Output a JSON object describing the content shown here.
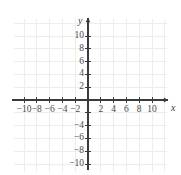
{
  "figure": {
    "kind": "cartesian-coordinate-plane",
    "width": 181,
    "height": 175,
    "background_color": "#ffffff"
  },
  "axes": {
    "x_name": "x",
    "y_name": "y",
    "axis_color": "#3a3a3a",
    "grid_color": "#ededed",
    "label_color": "#4a4a4a",
    "origin_px": {
      "x": 88,
      "y": 100
    },
    "pixels_per_unit": 6.4,
    "xlim": [
      -11.5,
      12.5
    ],
    "ylim": [
      -11.3,
      12.8
    ],
    "grid": true,
    "grid_step": 2,
    "tick_step": 2,
    "arrowheads": [
      "x-positive",
      "y-positive"
    ]
  },
  "chart_data": {
    "type": "scatter",
    "title": "",
    "xlabel": "x",
    "ylabel": "y",
    "series": [],
    "x": [],
    "values": [],
    "xlim": [
      -11.5,
      12.5
    ],
    "ylim": [
      -11.3,
      12.8
    ],
    "grid": true,
    "legend": "none",
    "x_ticks": [
      -10,
      -8,
      -6,
      -4,
      -2,
      2,
      4,
      6,
      8,
      10
    ],
    "y_ticks": [
      -10,
      -8,
      -6,
      -4,
      -2,
      2,
      4,
      6,
      8,
      10
    ],
    "x_tick_labels": [
      "-10",
      "-8",
      "-6",
      "-4",
      "-2",
      "2",
      "4",
      "6",
      "8",
      "10"
    ],
    "y_tick_labels": [
      "10",
      "8",
      "6",
      "4",
      "2",
      "-4",
      "-6",
      "-8",
      "-10"
    ],
    "y_tick_label_values": [
      10,
      8,
      6,
      4,
      2,
      -4,
      -6,
      -8,
      -10
    ]
  },
  "x_tick_labels": [
    {
      "value": -10,
      "text": "−10"
    },
    {
      "value": -8,
      "text": "−8"
    },
    {
      "value": -6,
      "text": "−6"
    },
    {
      "value": -4,
      "text": "−4"
    },
    {
      "value": -2,
      "text": "−2"
    },
    {
      "value": 2,
      "text": "2"
    },
    {
      "value": 4,
      "text": "4"
    },
    {
      "value": 6,
      "text": "6"
    },
    {
      "value": 8,
      "text": "8"
    },
    {
      "value": 10,
      "text": "10"
    }
  ],
  "y_tick_labels": [
    {
      "value": 10,
      "text": "10"
    },
    {
      "value": 8,
      "text": "8"
    },
    {
      "value": 6,
      "text": "6"
    },
    {
      "value": 4,
      "text": "4"
    },
    {
      "value": 2,
      "text": "2"
    },
    {
      "value": -4,
      "text": "−4"
    },
    {
      "value": -6,
      "text": "−6"
    },
    {
      "value": -8,
      "text": "−8"
    },
    {
      "value": -10,
      "text": "−10"
    }
  ]
}
